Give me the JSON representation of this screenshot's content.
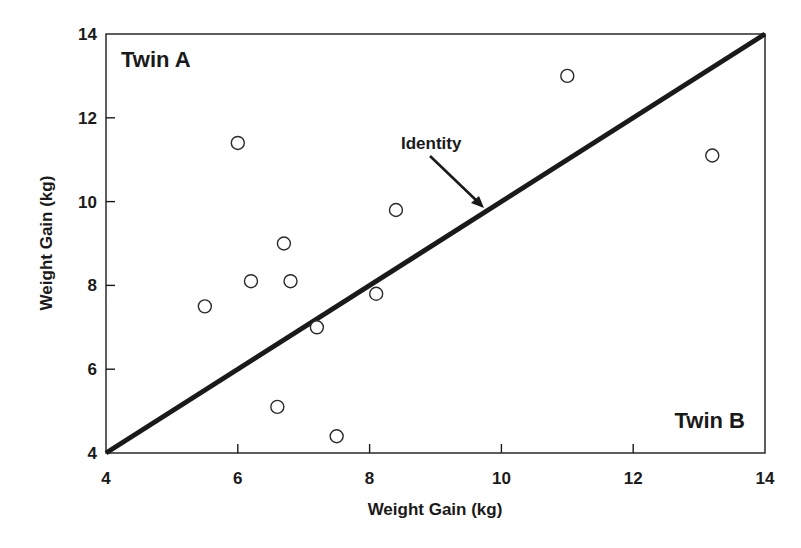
{
  "chart_data": {
    "type": "scatter",
    "title": "",
    "xlabel": "Weight Gain (kg)",
    "ylabel": "Weight Gain (kg)",
    "xlim": [
      4,
      14
    ],
    "ylim": [
      4,
      14
    ],
    "x_ticks": [
      4,
      6,
      8,
      10,
      12,
      14
    ],
    "y_ticks": [
      4,
      6,
      8,
      10,
      12,
      14
    ],
    "grid": false,
    "legend": null,
    "corner_labels": {
      "top_left": "Twin A",
      "bottom_right": "Twin B"
    },
    "annotations": [
      {
        "text": "Identity",
        "points_to": [
          9.8,
          9.8
        ],
        "style": "arrow"
      }
    ],
    "reference_line": {
      "name": "Identity",
      "from": [
        4,
        4
      ],
      "to": [
        14,
        14
      ]
    },
    "series": [
      {
        "name": "Twin pairs",
        "marker": "open-circle",
        "points": [
          {
            "x": 6.0,
            "y": 11.4
          },
          {
            "x": 11.0,
            "y": 13.0
          },
          {
            "x": 13.2,
            "y": 11.1
          },
          {
            "x": 8.4,
            "y": 9.8
          },
          {
            "x": 6.7,
            "y": 9.0
          },
          {
            "x": 6.2,
            "y": 8.1
          },
          {
            "x": 6.8,
            "y": 8.1
          },
          {
            "x": 5.5,
            "y": 7.5
          },
          {
            "x": 8.1,
            "y": 7.8
          },
          {
            "x": 7.2,
            "y": 7.0
          },
          {
            "x": 6.6,
            "y": 5.1
          },
          {
            "x": 7.5,
            "y": 4.4
          }
        ]
      }
    ]
  },
  "labels": {
    "twin_a": "Twin A",
    "twin_b": "Twin B",
    "identity": "Identity",
    "x_title": "Weight Gain (kg)",
    "y_title": "Weight Gain (kg)"
  },
  "colors": {
    "ink": "#1a1a1a",
    "background": "#ffffff"
  }
}
